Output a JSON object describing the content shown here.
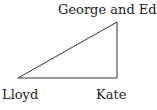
{
  "diagram": {
    "vertices": [
      {
        "id": "lloyd",
        "label": "Lloyd",
        "x": 18,
        "y": 78
      },
      {
        "id": "kate",
        "label": "Kate",
        "x": 117,
        "y": 78
      },
      {
        "id": "george_edna",
        "label": "George and Edna",
        "x": 117,
        "y": 22
      }
    ],
    "edges": [
      [
        "lloyd",
        "kate"
      ],
      [
        "kate",
        "george_edna"
      ],
      [
        "george_edna",
        "lloyd"
      ]
    ],
    "line_color": "#333333"
  }
}
